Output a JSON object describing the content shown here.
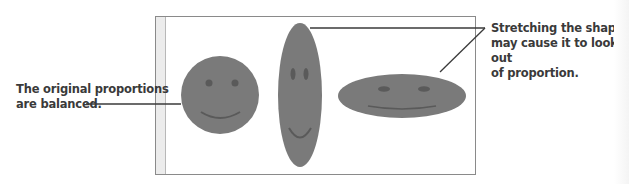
{
  "callouts": {
    "left": {
      "line1": "The original proportions",
      "line2": "are balanced."
    },
    "right": {
      "line1": "Stretching the shape",
      "line2": "may cause it to look out",
      "line3": "of proportion."
    }
  },
  "shapes": [
    {
      "name": "original-smiley",
      "type": "circle",
      "cx": 220,
      "cy": 95,
      "rx": 39,
      "ry": 39
    },
    {
      "name": "vertically-stretched-smiley",
      "type": "ellipse",
      "cx": 300,
      "cy": 95,
      "rx": 22,
      "ry": 72
    },
    {
      "name": "horizontally-stretched-smiley",
      "type": "ellipse",
      "cx": 402,
      "cy": 96,
      "rx": 64,
      "ry": 22
    }
  ],
  "colors": {
    "shape_fill": "#7a7a7a",
    "feature": "#5a5a5a",
    "frame_border": "#8a8a8a",
    "leader_line": "#3a3a3a",
    "text": "#3a3a3a"
  }
}
